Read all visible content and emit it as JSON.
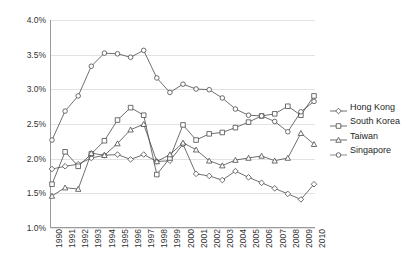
{
  "chart_data": {
    "type": "line",
    "title": "",
    "xlabel": "",
    "ylabel": "",
    "ylim": [
      1.0,
      4.0
    ],
    "ytick_labels": [
      "4.0%",
      "3.5%",
      "3.0%",
      "2.5%",
      "2.0%",
      "1.5%",
      "1.0%"
    ],
    "ytick_values": [
      4.0,
      3.5,
      3.0,
      2.5,
      2.0,
      1.5,
      1.0
    ],
    "yunit": "%",
    "grid": true,
    "legend_position": "right",
    "categories": [
      "1990",
      "1991",
      "1992",
      "1993",
      "1994",
      "1995",
      "1996",
      "1997",
      "1998",
      "1999",
      "2000",
      "2001",
      "2002",
      "2003",
      "2004",
      "2005",
      "2006",
      "2007",
      "2008",
      "2009",
      "2010"
    ],
    "series": [
      {
        "name": "Hong Kong",
        "marker": "diamond",
        "color": "#4a4a4a",
        "values": [
          1.84,
          1.88,
          1.91,
          2.0,
          2.04,
          2.05,
          1.98,
          2.05,
          1.95,
          1.96,
          2.2,
          1.77,
          1.74,
          1.68,
          1.81,
          1.72,
          1.64,
          1.56,
          1.48,
          1.4,
          1.62
        ]
      },
      {
        "name": "South Korea",
        "marker": "square",
        "color": "#4a4a4a",
        "values": [
          1.62,
          2.09,
          1.88,
          2.06,
          2.25,
          2.55,
          2.73,
          2.62,
          1.76,
          2.0,
          2.48,
          2.26,
          2.35,
          2.37,
          2.44,
          2.52,
          2.61,
          2.64,
          2.75,
          2.62,
          2.9
        ]
      },
      {
        "name": "Taiwan",
        "marker": "triangle",
        "color": "#4a4a4a",
        "values": [
          1.45,
          1.57,
          1.55,
          2.07,
          2.04,
          2.21,
          2.41,
          2.49,
          1.95,
          2.05,
          2.22,
          2.12,
          1.96,
          1.89,
          1.97,
          2.0,
          2.03,
          1.96,
          2.0,
          2.36,
          2.2
        ]
      },
      {
        "name": "Singapore",
        "marker": "circle",
        "color": "#6e6e6e",
        "values": [
          2.26,
          2.68,
          2.9,
          3.33,
          3.52,
          3.51,
          3.46,
          3.56,
          3.16,
          2.95,
          3.07,
          3.0,
          2.99,
          2.87,
          2.71,
          2.62,
          2.61,
          2.53,
          2.38,
          2.67,
          2.82
        ]
      }
    ]
  },
  "legend": {
    "items": [
      {
        "label": "Hong Kong",
        "marker": "diamond"
      },
      {
        "label": "South Korea",
        "marker": "square"
      },
      {
        "label": "Taiwan",
        "marker": "triangle"
      },
      {
        "label": "Singapore",
        "marker": "circle"
      }
    ]
  }
}
